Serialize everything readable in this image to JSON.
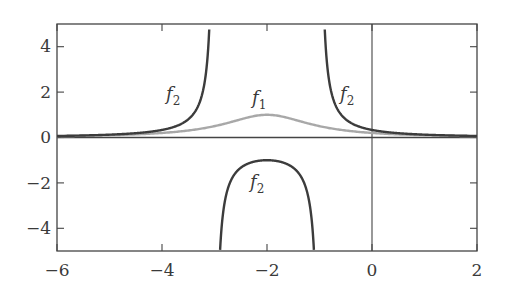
{
  "chart_data": {
    "type": "line",
    "title": "",
    "xlabel": "",
    "ylabel": "",
    "xlim": [
      -6,
      2
    ],
    "ylim": [
      -5,
      5
    ],
    "grid": false,
    "legend": "none (inline curve labels)",
    "x_ticks": [
      -6,
      -4,
      -2,
      0,
      2
    ],
    "x_tick_labels": [
      "−6",
      "−4",
      "−2",
      "0",
      "2"
    ],
    "y_ticks": [
      -4,
      -2,
      0,
      2,
      4
    ],
    "y_tick_labels": [
      "−4",
      "−2",
      "0",
      "2",
      "4"
    ],
    "reference_lines": [
      {
        "orientation": "horizontal",
        "value": 0
      },
      {
        "orientation": "vertical",
        "value": 0
      }
    ],
    "series": [
      {
        "name": "f1",
        "label": "f",
        "subscript": "1",
        "color": "#a0a0a0",
        "description": "bell-shaped curve peaking at (−2, 1), approx 1/((x+2)^2+1)",
        "x": [
          -6,
          -5,
          -4,
          -3.5,
          -3,
          -2.5,
          -2,
          -1.5,
          -1,
          -0.5,
          0,
          1,
          2
        ],
        "y": [
          0.06,
          0.1,
          0.2,
          0.31,
          0.5,
          0.8,
          1.0,
          0.8,
          0.5,
          0.31,
          0.2,
          0.1,
          0.06
        ]
      },
      {
        "name": "f2",
        "label": "f",
        "subscript": "2",
        "color": "#3c3c3c",
        "description": "approx 1/((x+2)^2−1); vertical asymptotes at x=−3 and x=−1; local max −1 at x=−2",
        "branches": [
          {
            "x": [
              -6,
              -5,
              -4,
              -3.5,
              -3.2,
              -3.1
            ],
            "y": [
              0.07,
              0.13,
              0.33,
              0.8,
              2.27,
              4.76
            ]
          },
          {
            "x": [
              -2.9,
              -2.8,
              -2.5,
              -2,
              -1.5,
              -1.2,
              -1.1
            ],
            "y": [
              -5.26,
              -2.78,
              -1.33,
              -1.0,
              -1.33,
              -2.78,
              -5.26
            ]
          },
          {
            "x": [
              -0.9,
              -0.8,
              -0.5,
              0,
              1,
              2
            ],
            "y": [
              4.76,
              2.27,
              0.8,
              0.33,
              0.13,
              0.07
            ]
          }
        ]
      }
    ],
    "annotations": [
      {
        "text": "f₂",
        "x": -3.6,
        "y": 1.8
      },
      {
        "text": "f₁",
        "x": -2.0,
        "y": 1.4
      },
      {
        "text": "f₂",
        "x": -0.55,
        "y": 1.8
      },
      {
        "text": "f₂",
        "x": -2.0,
        "y": -2.2
      }
    ]
  },
  "labels": {
    "f": "f",
    "sub1": "1",
    "sub2": "2"
  }
}
